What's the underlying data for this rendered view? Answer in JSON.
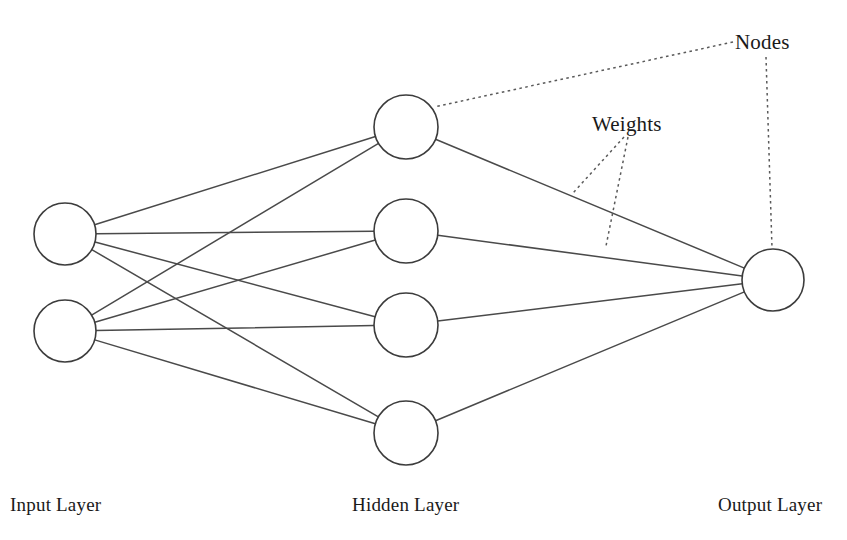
{
  "figure": {
    "background_color": "#ffffff",
    "width": 847,
    "height": 540
  },
  "style": {
    "node_stroke_color": "#3c3c3c",
    "node_fill_color": "#ffffff",
    "edge_color": "#4a4a4a",
    "leader_color": "#5a5a5a",
    "text_color": "#1a1a1a"
  },
  "layer_labels": [
    {
      "id": "input-layer-label",
      "text": "Input Layer",
      "x": 10,
      "y": 511
    },
    {
      "id": "hidden-layer-label",
      "text": "Hidden Layer",
      "x": 352,
      "y": 511
    },
    {
      "id": "output-layer-label",
      "text": "Output Layer",
      "x": 718,
      "y": 511
    }
  ],
  "annotations": [
    {
      "id": "nodes-annotation",
      "text": "Nodes",
      "x": 735,
      "y": 49,
      "leaders": [
        {
          "from": [
            733,
            42
          ],
          "to": [
            434,
            107
          ]
        },
        {
          "from": [
            766,
            57
          ],
          "to": [
            772,
            248
          ]
        }
      ]
    },
    {
      "id": "weights-annotation",
      "text": "Weights",
      "x": 592,
      "y": 131,
      "leaders": [
        {
          "from": [
            624,
            137
          ],
          "to": [
            573,
            193
          ]
        },
        {
          "from": [
            628,
            137
          ],
          "to": [
            606,
            246
          ]
        }
      ]
    }
  ],
  "network": {
    "layers": [
      {
        "id": "input",
        "name": "Input Layer",
        "node_count": 2,
        "nodes": [
          {
            "id": "i1",
            "cx": 65,
            "cy": 234,
            "r": 31
          },
          {
            "id": "i2",
            "cx": 65,
            "cy": 331,
            "r": 31
          }
        ]
      },
      {
        "id": "hidden",
        "name": "Hidden Layer",
        "node_count": 4,
        "nodes": [
          {
            "id": "h1",
            "cx": 406,
            "cy": 127,
            "r": 32
          },
          {
            "id": "h2",
            "cx": 406,
            "cy": 231,
            "r": 32
          },
          {
            "id": "h3",
            "cx": 406,
            "cy": 325,
            "r": 32
          },
          {
            "id": "h4",
            "cx": 406,
            "cy": 433,
            "r": 32
          }
        ]
      },
      {
        "id": "output",
        "name": "Output Layer",
        "node_count": 1,
        "nodes": [
          {
            "id": "o1",
            "cx": 773,
            "cy": 280,
            "r": 31
          }
        ]
      }
    ],
    "connections": [
      {
        "from": "i1",
        "to": "h1"
      },
      {
        "from": "i1",
        "to": "h2"
      },
      {
        "from": "i1",
        "to": "h3"
      },
      {
        "from": "i1",
        "to": "h4"
      },
      {
        "from": "i2",
        "to": "h1"
      },
      {
        "from": "i2",
        "to": "h2"
      },
      {
        "from": "i2",
        "to": "h3"
      },
      {
        "from": "i2",
        "to": "h4"
      },
      {
        "from": "h1",
        "to": "o1"
      },
      {
        "from": "h2",
        "to": "o1"
      },
      {
        "from": "h3",
        "to": "o1"
      },
      {
        "from": "h4",
        "to": "o1"
      }
    ]
  }
}
